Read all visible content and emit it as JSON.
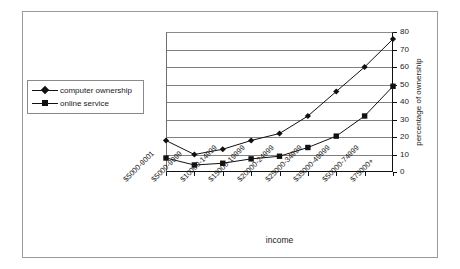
{
  "chart_data": {
    "type": "line",
    "title": "",
    "xlabel": "income",
    "ylabel": "percentage of ownership",
    "ylim": [
      0,
      80
    ],
    "ytick_step": 10,
    "yticks": [
      0,
      10,
      20,
      30,
      40,
      50,
      60,
      70,
      80
    ],
    "grid": "horizontal",
    "legend_position": "left-outside",
    "categories": [
      "$5000-9001",
      "$5000-9999",
      "$10000-14999",
      "$15000-19999",
      "$20000-24999",
      "$25000-34999",
      "$35000-49999",
      "$50000-74999",
      "$75000+"
    ],
    "series": [
      {
        "name": "computer ownership",
        "marker": "diamond",
        "color": "#111111",
        "values": [
          18,
          10,
          13,
          18,
          22,
          32,
          46,
          60,
          76
        ]
      },
      {
        "name": "online service",
        "marker": "square",
        "color": "#111111",
        "values": [
          8,
          4,
          5,
          7.5,
          9,
          14,
          20.5,
          32,
          49
        ]
      }
    ]
  },
  "axes": {
    "y_title": "percentage of ownership",
    "x_title": "income"
  },
  "legend": {
    "entries": [
      {
        "label": "computer ownership",
        "marker": "diamond"
      },
      {
        "label": "online service",
        "marker": "square"
      }
    ]
  },
  "colors": {
    "ink": "#111111",
    "grid": "#808080",
    "frame": "#9a9a9a"
  }
}
